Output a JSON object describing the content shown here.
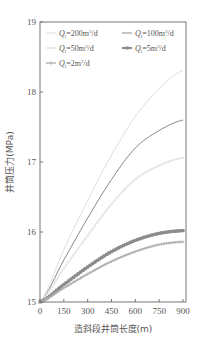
{
  "chart_data": {
    "type": "line",
    "title": "",
    "xlabel": "造斜段井筒长度(m)",
    "ylabel": "井筒压力(MPa)",
    "xlim": [
      0,
      900
    ],
    "ylim": [
      15,
      19
    ],
    "xticks": [
      0,
      150,
      300,
      450,
      600,
      750,
      900
    ],
    "yticks": [
      15,
      16,
      17,
      18,
      19
    ],
    "grid": false,
    "legend_position": "upper-left, 2 columns",
    "x": [
      0,
      150,
      300,
      450,
      600,
      750,
      900
    ],
    "series": [
      {
        "name": "Q_l=200m³/d",
        "label_main": "Q",
        "label_sub": "l",
        "label_rest": "=200m",
        "label_sup": "3",
        "label_tail": "/d",
        "color": "#dddddd",
        "marker": "none",
        "width": 1,
        "values": [
          15.0,
          15.75,
          16.45,
          17.1,
          17.65,
          18.05,
          18.31
        ]
      },
      {
        "name": "Q_l=100m³/d",
        "label_main": "Q",
        "label_sub": "l",
        "label_rest": "=100m",
        "label_sup": "3",
        "label_tail": "/d",
        "color": "#888888",
        "marker": "none",
        "width": 1,
        "values": [
          15.0,
          15.6,
          16.2,
          16.75,
          17.2,
          17.45,
          17.6
        ]
      },
      {
        "name": "Q_l=50m³/d",
        "label_main": "Q",
        "label_sub": "l",
        "label_rest": "=50m",
        "label_sup": "3",
        "label_tail": "/d",
        "color": "#e6e6e6",
        "marker": "dot",
        "width": 1.6,
        "values": [
          15.0,
          15.48,
          15.95,
          16.4,
          16.75,
          16.95,
          17.06
        ]
      },
      {
        "name": "Q_l=5m³/d",
        "label_main": "Q",
        "label_sub": "l",
        "label_rest": "=5m",
        "label_sup": "3",
        "label_tail": "/d",
        "color": "#8c8c8c",
        "marker": "square",
        "width": 2.6,
        "values": [
          15.0,
          15.25,
          15.5,
          15.72,
          15.88,
          15.98,
          16.02
        ]
      },
      {
        "name": "Q_l=2m³/d",
        "label_main": "Q",
        "label_sub": "l",
        "label_rest": "=2m",
        "label_sup": "3",
        "label_tail": "/d",
        "color": "#b0b0b0",
        "marker": "plus",
        "width": 1.4,
        "values": [
          15.0,
          15.2,
          15.4,
          15.58,
          15.72,
          15.82,
          15.86
        ]
      }
    ]
  }
}
